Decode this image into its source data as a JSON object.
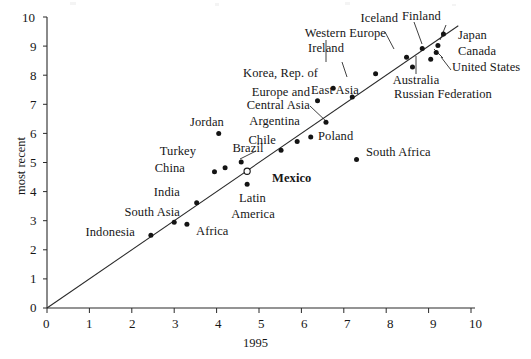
{
  "figure": {
    "xlabel": "1995",
    "ylabel": "most recent",
    "marker_color": "#141414",
    "line_color": "#2a2a2a"
  },
  "axes": {
    "xticks": [
      "0",
      "1",
      "2",
      "3",
      "4",
      "5",
      "6",
      "7",
      "8",
      "9",
      "10"
    ],
    "yticks": [
      "0",
      "1",
      "2",
      "3",
      "4",
      "5",
      "6",
      "7",
      "8",
      "9",
      "10"
    ]
  },
  "chart_data": {
    "type": "scatter",
    "title": "",
    "xlabel": "1995",
    "ylabel": "most recent",
    "xlim": [
      0,
      10
    ],
    "ylim": [
      0,
      10
    ],
    "grid": false,
    "legend": null,
    "reference_line": {
      "type": "identity",
      "from": [
        0,
        0
      ],
      "to": [
        9.7,
        9.7
      ],
      "label": "45-degree line"
    },
    "points": [
      {
        "label": "Indonesia",
        "x": 2.45,
        "y": 2.5,
        "marker": "filled"
      },
      {
        "label": "South Asia",
        "x": 3.0,
        "y": 2.95,
        "marker": "filled"
      },
      {
        "label": "Africa",
        "x": 3.3,
        "y": 2.88,
        "marker": "filled"
      },
      {
        "label": "India",
        "x": 3.53,
        "y": 3.62,
        "marker": "filled"
      },
      {
        "label": "China",
        "x": 3.95,
        "y": 4.68,
        "marker": "filled"
      },
      {
        "label": "Turkey",
        "x": 4.2,
        "y": 4.82,
        "marker": "filled"
      },
      {
        "label": "Jordan",
        "x": 4.05,
        "y": 6.0,
        "marker": "filled"
      },
      {
        "label": "Brazil",
        "x": 4.58,
        "y": 5.02,
        "marker": "filled"
      },
      {
        "label": "Mexico",
        "x": 4.72,
        "y": 4.7,
        "marker": "hollow"
      },
      {
        "label": "Latin America",
        "x": 4.72,
        "y": 4.25,
        "marker": "filled"
      },
      {
        "label": "Chile",
        "x": 5.52,
        "y": 5.42,
        "marker": "filled"
      },
      {
        "label": "Argentina",
        "x": 5.9,
        "y": 5.72,
        "marker": "filled"
      },
      {
        "label": "Poland",
        "x": 6.22,
        "y": 5.88,
        "marker": "filled"
      },
      {
        "label": "Europe and Central Asia",
        "x": 6.58,
        "y": 6.38,
        "marker": "filled"
      },
      {
        "label": "East Asia",
        "x": 6.38,
        "y": 7.12,
        "marker": "filled"
      },
      {
        "label": "Korea, Rep. of",
        "x": 6.75,
        "y": 7.55,
        "marker": "filled"
      },
      {
        "label": "Russian Federation",
        "x": 7.2,
        "y": 7.25,
        "marker": "filled"
      },
      {
        "label": "South Africa",
        "x": 7.3,
        "y": 5.1,
        "marker": "filled"
      },
      {
        "label": "Ireland",
        "x": 7.75,
        "y": 8.05,
        "marker": "filled"
      },
      {
        "label": "Western Europe",
        "x": 8.48,
        "y": 8.62,
        "marker": "filled"
      },
      {
        "label": "Australia",
        "x": 8.62,
        "y": 8.28,
        "marker": "filled"
      },
      {
        "label": "Iceland",
        "x": 8.85,
        "y": 8.92,
        "marker": "filled"
      },
      {
        "label": "United States",
        "x": 9.05,
        "y": 8.55,
        "marker": "filled"
      },
      {
        "label": "Canada",
        "x": 9.18,
        "y": 8.78,
        "marker": "filled"
      },
      {
        "label": "Japan",
        "x": 9.22,
        "y": 9.02,
        "marker": "filled"
      },
      {
        "label": "Finland",
        "x": 9.35,
        "y": 9.42,
        "marker": "filled"
      }
    ]
  },
  "labels": {
    "indonesia": "Indonesia",
    "south_asia": "South Asia",
    "africa": "Africa",
    "india": "India",
    "china": "China",
    "turkey": "Turkey",
    "jordan": "Jordan",
    "brazil": "Brazil",
    "mexico": "Mexico",
    "latin": "Latin",
    "america": "America",
    "chile": "Chile",
    "argentina": "Argentina",
    "poland": "Poland",
    "europe_and": "Europe and",
    "central_asia": "Central Asia",
    "east_asia": "East Asia",
    "korea": "Korea, Rep. of",
    "russia": "Russian Federation",
    "south_africa": "South Africa",
    "ireland": "Ireland",
    "western_europe": "Western Europe",
    "australia": "Australia",
    "iceland": "Iceland",
    "united_states": "United States",
    "canada": "Canada",
    "japan": "Japan",
    "finland": "Finland"
  }
}
